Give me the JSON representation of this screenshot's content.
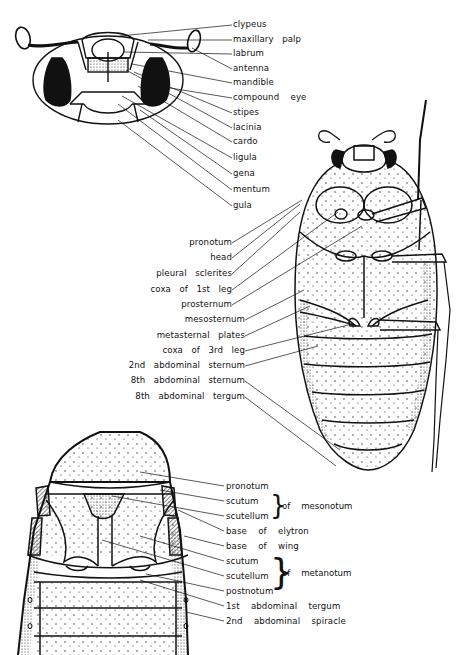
{
  "figure": {
    "head_view": {
      "labels": [
        {
          "text": "clypeus",
          "x": 233,
          "y": 23
        },
        {
          "text": "maxillary   palp",
          "x": 233,
          "y": 38
        },
        {
          "text": "labrum",
          "x": 233,
          "y": 52
        },
        {
          "text": "antenna",
          "x": 233,
          "y": 67
        },
        {
          "text": "mandible",
          "x": 233,
          "y": 81
        },
        {
          "text": "compound    eye",
          "x": 233,
          "y": 96
        },
        {
          "text": "stipes",
          "x": 233,
          "y": 111
        },
        {
          "text": "lacinia",
          "x": 233,
          "y": 126
        },
        {
          "text": "cardo",
          "x": 233,
          "y": 140
        },
        {
          "text": "ligula",
          "x": 233,
          "y": 156
        },
        {
          "text": "gena",
          "x": 233,
          "y": 172
        },
        {
          "text": "mentum",
          "x": 233,
          "y": 188
        },
        {
          "text": "gula",
          "x": 233,
          "y": 204
        }
      ]
    },
    "ventral_view": {
      "labels": [
        {
          "text": "pronotum",
          "right": 232,
          "y": 241
        },
        {
          "text": "head",
          "right": 232,
          "y": 256
        },
        {
          "text": "pleural   sclerites",
          "right": 232,
          "y": 272
        },
        {
          "text": "coxa   of   1st   leg",
          "right": 232,
          "y": 288
        },
        {
          "text": "prosternum",
          "right": 232,
          "y": 303
        },
        {
          "text": "mesosternum",
          "right": 245,
          "y": 318
        },
        {
          "text": "metasternal   plates",
          "right": 245,
          "y": 334
        },
        {
          "text": "coxa   of   3rd   leg",
          "right": 245,
          "y": 349
        },
        {
          "text": "2nd   abdominal   sternum",
          "right": 245,
          "y": 364
        },
        {
          "text": "8th   abdominal   sternum",
          "right": 245,
          "y": 379
        },
        {
          "text": "8th   abdominal   tergum",
          "right": 245,
          "y": 395
        }
      ]
    },
    "dorsal_view": {
      "labels": [
        {
          "text": "pronotum",
          "x": 225,
          "y": 484
        },
        {
          "text": "scutum",
          "x": 225,
          "y": 499
        },
        {
          "text": "scutellum",
          "x": 225,
          "y": 514
        },
        {
          "text": "base    of    elytron",
          "x": 225,
          "y": 529
        },
        {
          "text": "base    of    wing",
          "x": 225,
          "y": 544
        },
        {
          "text": "scutum",
          "x": 225,
          "y": 559
        },
        {
          "text": "scutellum",
          "x": 225,
          "y": 574
        },
        {
          "text": "postnotum",
          "x": 225,
          "y": 589
        },
        {
          "text": "1st    abdominal    tergum",
          "x": 225,
          "y": 604
        },
        {
          "text": "2nd    abdominal    spiracle",
          "x": 225,
          "y": 619
        }
      ],
      "groups": [
        {
          "text": "of    mesonotum",
          "x": 281,
          "y": 506
        },
        {
          "text": "of    metanotum",
          "x": 281,
          "y": 574
        }
      ]
    }
  }
}
